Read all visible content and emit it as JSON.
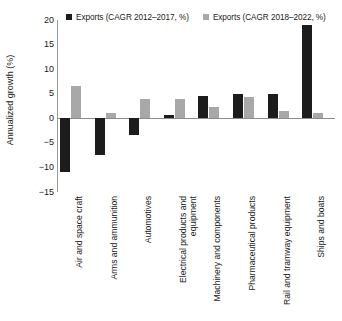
{
  "chart": {
    "type": "bar",
    "ylabel": "Annualized growth (%)",
    "legend": [
      {
        "label": "Exports (CAGR 2012–2017, %)",
        "color": "#1c1c1c",
        "swatch": "legend-swatch-black"
      },
      {
        "label": "Exports (CAGR 2018–2022, %)",
        "color": "#a8a8a8",
        "swatch": "legend-swatch-gray"
      }
    ],
    "yticks": [
      "20",
      "15",
      "10",
      "5",
      "0",
      "−5",
      "−10",
      "−15"
    ]
  },
  "chart_data": {
    "type": "bar",
    "title": "",
    "xlabel": "",
    "ylabel": "Annualized growth (%)",
    "ylim": [
      -15,
      20
    ],
    "yticks": [
      20,
      15,
      10,
      5,
      0,
      -5,
      -10,
      -15
    ],
    "grid": false,
    "legend_position": "top",
    "categories": [
      "Air and space craft",
      "Arms and ammunition",
      "Automotives",
      "Electrical products and equipment",
      "Machinery and components",
      "Pharmaceutical products",
      "Rail and tramway equipment",
      "Ships and boats"
    ],
    "series": [
      {
        "name": "Exports (CAGR 2012–2017, %)",
        "color": "#1c1c1c",
        "values": [
          -11.0,
          -7.5,
          -3.5,
          0.7,
          4.5,
          5.0,
          5.0,
          19.0
        ]
      },
      {
        "name": "Exports (CAGR 2018–2022, %)",
        "color": "#a8a8a8",
        "values": [
          6.5,
          1.0,
          4.0,
          4.0,
          2.3,
          4.3,
          1.5,
          1.0
        ]
      }
    ]
  },
  "categories_display": [
    "Air and space craft",
    "Arms and ammunition",
    "Automotives",
    "Electrical products and equipment",
    "Machinery and components",
    "Pharmaceutical products",
    "Rail and tramway equipment",
    "Ships and boats"
  ]
}
